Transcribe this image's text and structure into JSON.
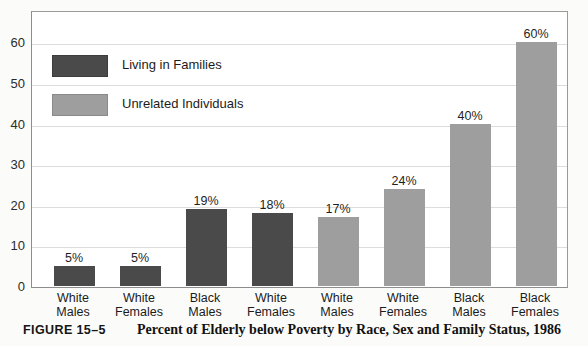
{
  "chart_data": {
    "type": "bar",
    "title": "Percent of Elderly below Poverty by Race, Sex and Family Status, 1986",
    "xlabel": "",
    "ylabel": "",
    "ylim": [
      0,
      68
    ],
    "yticks": [
      0,
      10,
      20,
      30,
      40,
      50,
      60
    ],
    "grid": true,
    "legend_position": "upper-left",
    "categories": [
      "White Males",
      "White Females",
      "Black Males",
      "White Females",
      "White Males",
      "White Females",
      "Black Males",
      "Black Females"
    ],
    "bars": [
      {
        "line1": "White",
        "line2": "Males",
        "value": 5,
        "label": "5%",
        "series": "Living in Families"
      },
      {
        "line1": "White",
        "line2": "Females",
        "value": 5,
        "label": "5%",
        "series": "Living in Families"
      },
      {
        "line1": "Black",
        "line2": "Males",
        "value": 19,
        "label": "19%",
        "series": "Living in Families"
      },
      {
        "line1": "White",
        "line2": "Females",
        "value": 18,
        "label": "18%",
        "series": "Living in Families"
      },
      {
        "line1": "White",
        "line2": "Males",
        "value": 17,
        "label": "17%",
        "series": "Unrelated Individuals"
      },
      {
        "line1": "White",
        "line2": "Females",
        "value": 24,
        "label": "24%",
        "series": "Unrelated Individuals"
      },
      {
        "line1": "Black",
        "line2": "Males",
        "value": 40,
        "label": "40%",
        "series": "Unrelated Individuals"
      },
      {
        "line1": "Black",
        "line2": "Females",
        "value": 60,
        "label": "60%",
        "series": "Unrelated Individuals"
      }
    ],
    "series": [
      {
        "name": "Living in Families",
        "color": "#4a4a4a",
        "values": [
          5,
          5,
          19,
          18,
          null,
          null,
          null,
          null
        ]
      },
      {
        "name": "Unrelated Individuals",
        "color": "#9e9e9e",
        "values": [
          null,
          null,
          null,
          null,
          17,
          24,
          40,
          60
        ]
      }
    ]
  },
  "legend": {
    "items": [
      {
        "label": "Living in Families",
        "color": "#4a4a4a"
      },
      {
        "label": "Unrelated Individuals",
        "color": "#9e9e9e"
      }
    ]
  },
  "yaxis": {
    "ticks": [
      "60",
      "50",
      "40",
      "30",
      "20",
      "10",
      "0"
    ]
  },
  "caption": {
    "number": "FIGURE 15–5",
    "title": "Percent of Elderly below Poverty by Race, Sex and Family Status, 1986"
  }
}
